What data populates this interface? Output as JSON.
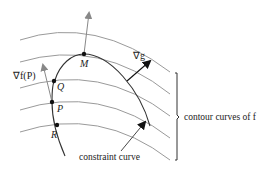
{
  "diagram": {
    "points": {
      "M": "M",
      "Q": "Q",
      "P": "P",
      "R": "R"
    },
    "labels": {
      "grad_f_P": "∇f(P)",
      "grad_g": "∇g",
      "constraint_curve": "constraint curve",
      "contour_curves": "contour curves of f"
    },
    "colors": {
      "contour": "#9a9a9a",
      "constraint": "#333333",
      "gradient_f_arrow": "#888888",
      "gradient_g_arrow": "#111111"
    }
  }
}
